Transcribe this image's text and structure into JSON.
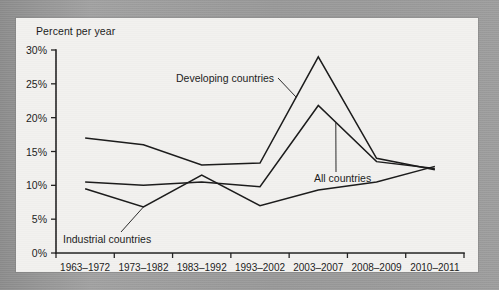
{
  "figure": {
    "y_axis_title": "Percent per year"
  },
  "annotations": {
    "developing": "Developing countries",
    "all": "All countries",
    "industrial": "Industrial countries"
  },
  "chart_data": {
    "type": "line",
    "title": "",
    "subtitle": "",
    "xlabel": "",
    "ylabel": "Percent per year",
    "ylim": [
      0,
      30
    ],
    "ytick_labels": [
      "0%",
      "5%",
      "10%",
      "15%",
      "20%",
      "25%",
      "30%"
    ],
    "ytick_values": [
      0,
      5,
      10,
      15,
      20,
      25,
      30
    ],
    "grid": false,
    "legend_position": "inline-annotations",
    "categories": [
      "1963–1972",
      "1973–1982",
      "1983–1992",
      "1993–2002",
      "2003–2007",
      "2008–2009",
      "2010–2011"
    ],
    "series": [
      {
        "name": "Developing countries",
        "values": [
          17.0,
          16.0,
          13.0,
          13.3,
          29.0,
          14.0,
          12.3
        ]
      },
      {
        "name": "All countries",
        "values": [
          10.5,
          10.0,
          10.5,
          9.8,
          21.8,
          13.5,
          12.5
        ]
      },
      {
        "name": "Industrial countries",
        "values": [
          9.5,
          6.8,
          11.5,
          7.0,
          9.3,
          10.5,
          12.8
        ]
      }
    ]
  }
}
